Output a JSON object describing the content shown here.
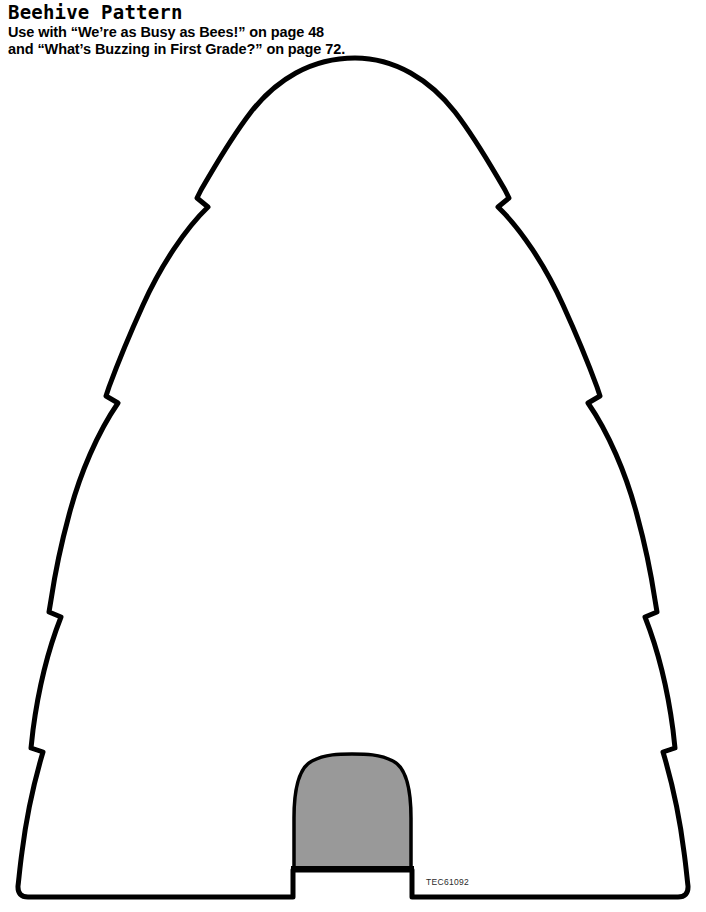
{
  "document": {
    "title": "Beehive Pattern",
    "instructions": {
      "line1": "Use with “We’re as Busy as Bees!” on page 48",
      "line2": "and “What’s Buzzing in First Grade?” on page 72."
    },
    "product_code": "TEC61092",
    "background_color": "#ffffff"
  },
  "artwork": {
    "name": "beehive-pattern-outline",
    "outline_color": "#000000",
    "fill_color": "#ffffff",
    "stroke_width": 5,
    "entrance": {
      "name": "beehive-entrance",
      "fill_color": "#999999",
      "outline_color": "#000000"
    },
    "tiers": 5,
    "notch_count": 8
  }
}
